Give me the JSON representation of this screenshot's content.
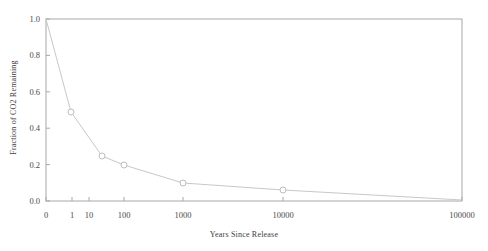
{
  "chart_data": {
    "type": "line",
    "title": "",
    "xlabel": "Years Since Release",
    "ylabel": "Fraction of CO2 Remaining",
    "x_tick_labels": [
      "0",
      "1",
      "10",
      "100",
      "1000",
      "10000",
      "100000"
    ],
    "x_tick_positions_px": [
      46,
      72,
      89,
      124,
      183,
      283,
      462
    ],
    "y_tick_labels": [
      "0.0",
      "0.2",
      "0.4",
      "0.6",
      "0.8",
      "1.0"
    ],
    "y_ticks": [
      0.0,
      0.2,
      0.4,
      0.6,
      0.8,
      1.0
    ],
    "ylim": [
      0.0,
      1.0
    ],
    "grid": false,
    "legend": null,
    "marker": "open-circle",
    "series": [
      {
        "name": "Fraction of CO2 Remaining",
        "x_labels": [
          "0",
          "1",
          "30",
          "100",
          "1000",
          "10000",
          "100000"
        ],
        "points_px": [
          {
            "x": 46,
            "y": 19
          },
          {
            "x": 71,
            "y": 112
          },
          {
            "x": 102,
            "y": 156
          },
          {
            "x": 124,
            "y": 165
          },
          {
            "x": 183,
            "y": 183
          },
          {
            "x": 283,
            "y": 190
          },
          {
            "x": 462,
            "y": 200
          }
        ],
        "values": [
          1.0,
          0.5,
          0.25,
          0.2,
          0.1,
          0.055,
          0.005
        ]
      }
    ],
    "colors": {
      "line": "#c8c8c8",
      "marker_edge": "#bdbdbd",
      "marker_face": "#ffffff",
      "axis": "#a8a8a8",
      "text": "#4a4a4a",
      "background": "#ffffff"
    }
  },
  "figure": {
    "plot_area_px": {
      "left": 46,
      "top": 19,
      "right": 462,
      "bottom": 201
    }
  }
}
